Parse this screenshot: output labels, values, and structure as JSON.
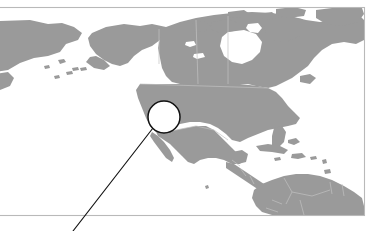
{
  "figure": {
    "type": "map",
    "canvas": {
      "width": 377,
      "height": 231
    },
    "background_color": "#ffffff"
  },
  "frame": {
    "name": "figure-border",
    "top_y": 7,
    "right_x": 365,
    "bottom_y": 215,
    "left_x": -4,
    "stroke_color": "#b9b9b9",
    "stroke_width": 1.1,
    "note": "Left edge of the frame is cropped beyond the left image boundary"
  },
  "map": {
    "projection": "equirectangular",
    "land_color": "#9a9a9a",
    "water_color": "#ffffff",
    "border_color": "#c2c2c2",
    "regions_visible": [
      "Alaska",
      "Northeastern Russia (Chukotka)",
      "Canada",
      "Canadian Arctic Archipelago",
      "Greenland (western edge)",
      "Contiguous United States",
      "Mexico",
      "Central America",
      "Caribbean islands",
      "Cuba",
      "Hispaniola",
      "Northern South America",
      "Colombia",
      "Venezuela",
      "Guyana",
      "Suriname",
      "Brazil (northern)",
      "Ecuador",
      "Peru (northern)"
    ],
    "water_bodies_visible": [
      "Pacific Ocean",
      "Atlantic Ocean",
      "Arctic Ocean",
      "Gulf of Mexico",
      "Caribbean Sea",
      "Hudson Bay",
      "Bering Sea",
      "Great Lakes"
    ]
  },
  "callout": {
    "name": "location-callout",
    "shape": "circle",
    "center_x": 164,
    "center_y": 117,
    "radius": 16,
    "fill_color": "#ffffff",
    "stroke_color": "#111111",
    "stroke_width": 1.5,
    "approximate_location": "Southwestern United States",
    "leader_line": {
      "start_x": 153,
      "start_y": 128,
      "end_x": 73,
      "end_y": 231,
      "stroke_color": "#141414",
      "stroke_width": 1.15
    }
  },
  "labels": {
    "text_items": []
  }
}
